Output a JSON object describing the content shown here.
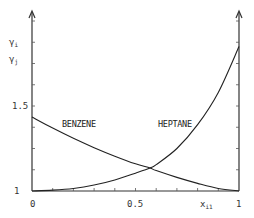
{
  "chart_data": {
    "type": "line",
    "title": "",
    "xlabel": "x_i1",
    "ylabel": "γ_i / γ_j",
    "xlim": [
      0,
      1
    ],
    "ylim": [
      1,
      1.95
    ],
    "x_ticks": [
      "0",
      "0.5",
      "1"
    ],
    "y_ticks": [
      "1",
      "1.5"
    ],
    "grid": false,
    "legend": "inline labels",
    "series": [
      {
        "name": "BENZENE",
        "x": [
          0,
          0.1,
          0.2,
          0.3,
          0.4,
          0.5,
          0.57,
          0.6,
          0.7,
          0.8,
          0.9,
          1.0
        ],
        "values": [
          1.435,
          1.37,
          1.31,
          1.255,
          1.205,
          1.16,
          1.135,
          1.12,
          1.08,
          1.045,
          1.015,
          1.0
        ]
      },
      {
        "name": "HEPTANE",
        "x": [
          0,
          0.1,
          0.2,
          0.3,
          0.4,
          0.5,
          0.57,
          0.6,
          0.7,
          0.8,
          0.9,
          1.0
        ],
        "values": [
          1.0,
          1.005,
          1.015,
          1.035,
          1.065,
          1.105,
          1.135,
          1.155,
          1.25,
          1.39,
          1.58,
          1.85
        ]
      }
    ]
  },
  "labels": {
    "y_axis_top": "γ_i",
    "y_axis_sub": "γ_j",
    "y_tick_1": "1",
    "y_tick_15": "1.5",
    "x_tick_0": "0",
    "x_tick_05": "0.5",
    "x_tick_1": "1",
    "x_axis": "x_i1",
    "benzene": "BENZENE",
    "heptane": "HEPTANE"
  }
}
